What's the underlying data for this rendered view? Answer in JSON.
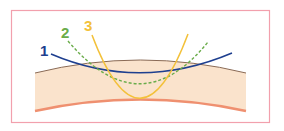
{
  "diagram": {
    "frame_color": "#f2a0ad",
    "band": {
      "fill": "#fae3cc",
      "top_edge_color": "#8a6a55",
      "bottom_edge_color": "#ef9070"
    },
    "curves": [
      {
        "label": "1",
        "color": "#1e3f8f",
        "style": "solid",
        "description": "shallow wide curve"
      },
      {
        "label": "2",
        "color": "#6aac4a",
        "style": "dashed",
        "description": "medium curve"
      },
      {
        "label": "3",
        "color": "#f3c13a",
        "style": "solid",
        "description": "steep narrow curve"
      }
    ]
  }
}
